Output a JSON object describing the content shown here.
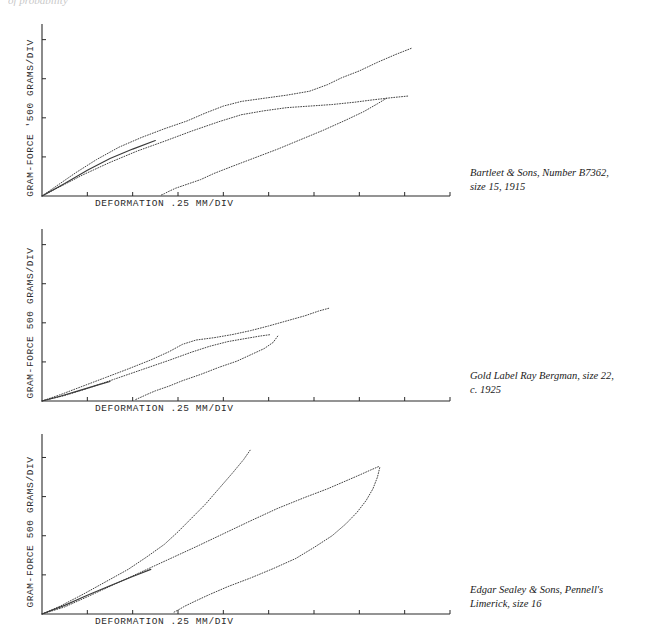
{
  "top_fragment": "of probability",
  "axis_color": "#2b2b2b",
  "curve_color": "#3a3a3a",
  "panels": [
    {
      "id": "panel-bartleet",
      "ylabel": "GRAM-FORCE  '500  GRAMS/DIV",
      "xlabel": "DEFORMATION    .25 MM/DIV",
      "caption_lines": [
        "Bartleet & Sons, Number B7362,",
        "size 15, 1915"
      ]
    },
    {
      "id": "panel-bergman",
      "ylabel": "GRAM-FORCE  500  GRAMS/DIV",
      "xlabel": "DEFORMATION    .25 MM/DIV",
      "caption_lines": [
        "Gold Label Ray Bergman, size 22,",
        "c. 1925"
      ]
    },
    {
      "id": "panel-sealey",
      "ylabel": "GRAM-FORCE  500  GRAMS/DIV",
      "xlabel": "DEFORMATION    .25 MM/DIV",
      "caption_lines": [
        "Edgar Sealey & Sons, Pennell's",
        "Limerick, size 16"
      ]
    }
  ],
  "chart_data": [
    {
      "type": "line",
      "title": "Bartleet & Sons, Number B7362, size 15, 1915",
      "xlabel": "DEFORMATION  .25 MM/DIV",
      "ylabel": "GRAM-FORCE  500 GRAMS/DIV",
      "xlim": [
        0,
        9
      ],
      "ylim": [
        0,
        4.4
      ],
      "grid": false,
      "x_tick_count": 9,
      "y_tick_count": 4,
      "x_tick_step": 1,
      "y_tick_step": 1,
      "series": [
        {
          "name": "loading-outer",
          "points": [
            [
              0,
              0
            ],
            [
              0.35,
              0.28
            ],
            [
              0.75,
              0.6
            ],
            [
              1.2,
              0.93
            ],
            [
              1.7,
              1.25
            ],
            [
              2.2,
              1.5
            ],
            [
              2.7,
              1.72
            ],
            [
              3.2,
              1.92
            ],
            [
              3.6,
              2.12
            ],
            [
              4.0,
              2.3
            ],
            [
              4.4,
              2.42
            ],
            [
              4.9,
              2.5
            ],
            [
              5.4,
              2.58
            ],
            [
              5.9,
              2.68
            ],
            [
              6.3,
              2.85
            ],
            [
              6.6,
              3.02
            ],
            [
              7.0,
              3.2
            ],
            [
              7.4,
              3.42
            ],
            [
              7.8,
              3.62
            ],
            [
              8.15,
              3.78
            ]
          ]
        },
        {
          "name": "loading-inner",
          "points": [
            [
              0,
              0
            ],
            [
              0.4,
              0.24
            ],
            [
              0.9,
              0.54
            ],
            [
              1.5,
              0.86
            ],
            [
              2.1,
              1.15
            ],
            [
              2.7,
              1.4
            ],
            [
              3.3,
              1.66
            ],
            [
              3.9,
              1.9
            ],
            [
              4.4,
              2.08
            ],
            [
              4.9,
              2.18
            ],
            [
              5.4,
              2.26
            ],
            [
              5.9,
              2.3
            ],
            [
              6.4,
              2.34
            ],
            [
              6.9,
              2.4
            ],
            [
              7.3,
              2.46
            ],
            [
              7.75,
              2.52
            ],
            [
              8.1,
              2.56
            ]
          ]
        },
        {
          "name": "unloading",
          "points": [
            [
              7.6,
              2.5
            ],
            [
              7.4,
              2.36
            ],
            [
              7.1,
              2.16
            ],
            [
              6.7,
              1.94
            ],
            [
              6.2,
              1.68
            ],
            [
              5.7,
              1.44
            ],
            [
              5.2,
              1.2
            ],
            [
              4.7,
              0.98
            ],
            [
              4.2,
              0.76
            ],
            [
              3.8,
              0.58
            ],
            [
              3.5,
              0.42
            ],
            [
              3.2,
              0.3
            ],
            [
              2.95,
              0.2
            ],
            [
              2.8,
              0.12
            ],
            [
              2.7,
              0.06
            ],
            [
              2.62,
              0.02
            ]
          ]
        },
        {
          "name": "return-leg",
          "points": [
            [
              0,
              0
            ],
            [
              0.5,
              0.32
            ],
            [
              1.0,
              0.66
            ],
            [
              1.5,
              0.96
            ],
            [
              2.0,
              1.2
            ],
            [
              2.5,
              1.42
            ]
          ]
        }
      ]
    },
    {
      "type": "line",
      "title": "Gold Label Ray Bergman, size 22, c. 1925",
      "xlabel": "DEFORMATION  .25 MM/DIV",
      "ylabel": "GRAM-FORCE  500 GRAMS/DIV",
      "xlim": [
        0,
        9
      ],
      "ylim": [
        0,
        4.4
      ],
      "grid": false,
      "x_tick_count": 9,
      "y_tick_count": 4,
      "x_tick_step": 1,
      "y_tick_step": 1,
      "series": [
        {
          "name": "loading-outer",
          "points": [
            [
              0,
              0
            ],
            [
              0.4,
              0.16
            ],
            [
              0.9,
              0.38
            ],
            [
              1.4,
              0.6
            ],
            [
              1.9,
              0.82
            ],
            [
              2.4,
              1.05
            ],
            [
              2.8,
              1.26
            ],
            [
              3.1,
              1.45
            ],
            [
              3.4,
              1.56
            ],
            [
              3.8,
              1.62
            ],
            [
              4.2,
              1.7
            ],
            [
              4.6,
              1.8
            ],
            [
              5.0,
              1.92
            ],
            [
              5.4,
              2.05
            ],
            [
              5.8,
              2.18
            ],
            [
              6.1,
              2.3
            ],
            [
              6.35,
              2.38
            ]
          ]
        },
        {
          "name": "loading-inner",
          "points": [
            [
              0,
              0
            ],
            [
              0.5,
              0.14
            ],
            [
              1.0,
              0.32
            ],
            [
              1.6,
              0.56
            ],
            [
              2.2,
              0.8
            ],
            [
              2.8,
              1.04
            ],
            [
              3.3,
              1.25
            ],
            [
              3.7,
              1.4
            ],
            [
              4.1,
              1.52
            ],
            [
              4.5,
              1.6
            ],
            [
              4.8,
              1.66
            ],
            [
              5.05,
              1.7
            ]
          ]
        },
        {
          "name": "unloading",
          "points": [
            [
              5.2,
              1.66
            ],
            [
              5.1,
              1.5
            ],
            [
              4.9,
              1.34
            ],
            [
              4.6,
              1.18
            ],
            [
              4.3,
              1.02
            ],
            [
              3.9,
              0.86
            ],
            [
              3.5,
              0.68
            ],
            [
              3.1,
              0.52
            ],
            [
              2.8,
              0.38
            ],
            [
              2.5,
              0.26
            ],
            [
              2.3,
              0.16
            ],
            [
              2.15,
              0.08
            ],
            [
              2.05,
              0.03
            ]
          ]
        },
        {
          "name": "return-leg",
          "points": [
            [
              0,
              0
            ],
            [
              0.4,
              0.12
            ],
            [
              0.8,
              0.26
            ],
            [
              1.2,
              0.4
            ],
            [
              1.5,
              0.5
            ]
          ]
        }
      ]
    },
    {
      "type": "line",
      "title": "Edgar Sealey & Sons, Pennell's Limerick, size 16",
      "xlabel": "DEFORMATION  .25 MM/DIV",
      "ylabel": "GRAM-FORCE  500 GRAMS/DIV",
      "xlim": [
        0,
        9
      ],
      "ylim": [
        0,
        4.6
      ],
      "grid": false,
      "x_tick_count": 9,
      "y_tick_count": 5,
      "x_tick_step": 1,
      "y_tick_step": 1,
      "series": [
        {
          "name": "loading-outer",
          "points": [
            [
              0,
              0
            ],
            [
              0.4,
              0.2
            ],
            [
              0.9,
              0.5
            ],
            [
              1.4,
              0.82
            ],
            [
              1.9,
              1.14
            ],
            [
              2.3,
              1.45
            ],
            [
              2.7,
              1.78
            ],
            [
              3.0,
              2.1
            ],
            [
              3.3,
              2.45
            ],
            [
              3.6,
              2.8
            ],
            [
              3.9,
              3.2
            ],
            [
              4.2,
              3.6
            ],
            [
              4.45,
              3.95
            ],
            [
              4.6,
              4.2
            ]
          ]
        },
        {
          "name": "loading-inner",
          "points": [
            [
              0,
              0
            ],
            [
              0.5,
              0.18
            ],
            [
              1.0,
              0.44
            ],
            [
              1.6,
              0.76
            ],
            [
              2.2,
              1.08
            ],
            [
              2.8,
              1.4
            ],
            [
              3.4,
              1.72
            ],
            [
              4.0,
              2.05
            ],
            [
              4.6,
              2.38
            ],
            [
              5.2,
              2.7
            ],
            [
              5.8,
              2.98
            ],
            [
              6.3,
              3.2
            ],
            [
              6.7,
              3.4
            ],
            [
              7.0,
              3.55
            ],
            [
              7.25,
              3.68
            ],
            [
              7.45,
              3.78
            ]
          ]
        },
        {
          "name": "unloading",
          "points": [
            [
              7.45,
              3.74
            ],
            [
              7.4,
              3.5
            ],
            [
              7.3,
              3.2
            ],
            [
              7.15,
              2.9
            ],
            [
              6.95,
              2.6
            ],
            [
              6.7,
              2.3
            ],
            [
              6.4,
              2.0
            ],
            [
              6.0,
              1.7
            ],
            [
              5.6,
              1.42
            ],
            [
              5.1,
              1.16
            ],
            [
              4.6,
              0.92
            ],
            [
              4.1,
              0.7
            ],
            [
              3.7,
              0.5
            ],
            [
              3.4,
              0.34
            ],
            [
              3.15,
              0.2
            ],
            [
              3.0,
              0.1
            ],
            [
              2.9,
              0.04
            ]
          ]
        },
        {
          "name": "return-leg",
          "points": [
            [
              0,
              0
            ],
            [
              0.5,
              0.22
            ],
            [
              1.0,
              0.48
            ],
            [
              1.5,
              0.72
            ],
            [
              2.0,
              0.96
            ],
            [
              2.4,
              1.14
            ]
          ]
        }
      ]
    }
  ]
}
